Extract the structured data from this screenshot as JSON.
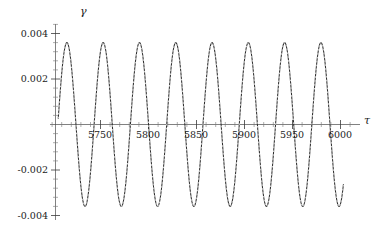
{
  "chart_data": {
    "type": "line",
    "title": "",
    "subtitle": "",
    "xlabel": "τ",
    "ylabel": "γ",
    "grid": false,
    "legend": null,
    "xlim": [
      5706,
      6010
    ],
    "ylim": [
      -0.0043,
      0.0043
    ],
    "xticks": [
      5750,
      5800,
      5850,
      5900,
      5950,
      6000
    ],
    "xticklabels": [
      "5750",
      "5800",
      "5850",
      "5900",
      "5950",
      "6000"
    ],
    "yticks": [
      -0.004,
      -0.002,
      0.002,
      0.004
    ],
    "yticklabels": [
      "-0.004",
      "-0.002",
      "0.002",
      "0.004"
    ],
    "series": [
      {
        "name": "gamma",
        "style": "solid-with-dotted-overlay",
        "color": "#2b2b2b",
        "linewidth": 1.0,
        "amplitude": 0.0036,
        "period": 37.8,
        "phase_x_first_peak": 5715,
        "x_start": 5706,
        "x_end": 6003,
        "description": "Sustained sinusoidal oscillation of gamma versus tau with constant amplitude near 0.0036, eight full peaks visible between tau 5706 and 6003."
      }
    ],
    "peaks_tau": [
      5715,
      5753,
      5791,
      5828,
      5866,
      5904,
      5942,
      5979
    ],
    "peaks_gamma": [
      0.0036,
      0.0036,
      0.0036,
      0.0036,
      0.0036,
      0.0036,
      0.0036,
      0.0036
    ],
    "troughs_tau": [
      5734,
      5772,
      5810,
      5847,
      5885,
      5923,
      5961,
      5998
    ],
    "troughs_gamma": [
      -0.0036,
      -0.0036,
      -0.0036,
      -0.0036,
      -0.0036,
      -0.0036,
      -0.0036,
      -0.0036
    ]
  },
  "axes": {
    "gamma_label": "γ",
    "tau_label": "τ"
  }
}
